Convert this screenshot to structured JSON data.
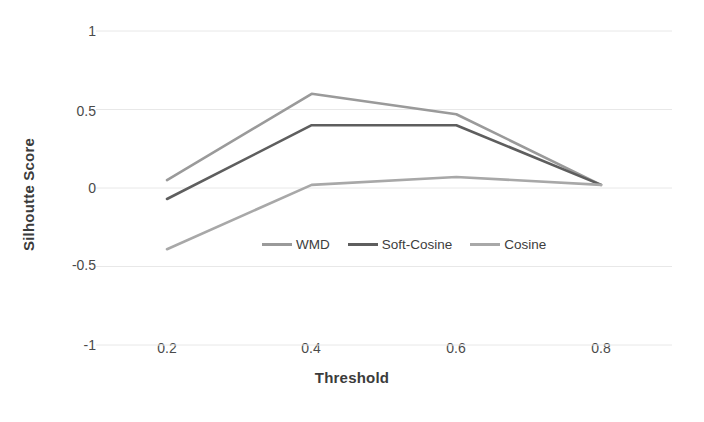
{
  "chart_data": {
    "type": "line",
    "title": "",
    "xlabel": "Threshold",
    "ylabel": "Silhoutte Score",
    "x": [
      0.2,
      0.4,
      0.6,
      0.8
    ],
    "xtick_labels": [
      "0.2",
      "0.4",
      "0.6",
      "0.8"
    ],
    "ytick_labels": [
      "1",
      "0.5",
      "0",
      "-0.5",
      "-1"
    ],
    "ytick_values": [
      1,
      0.5,
      0,
      -0.5,
      -1
    ],
    "ylim": [
      -1,
      1
    ],
    "xlim": [
      0.1,
      0.9
    ],
    "grid": "horizontal",
    "legend_position": "inside-center",
    "series": [
      {
        "name": "WMD",
        "color": "#9a9a9a",
        "values": [
          0.05,
          0.6,
          0.47,
          0.02
        ]
      },
      {
        "name": "Soft-Cosine",
        "color": "#5e5e5e",
        "values": [
          -0.07,
          0.4,
          0.4,
          0.02
        ]
      },
      {
        "name": "Cosine",
        "color": "#a8a8a8",
        "values": [
          -0.39,
          0.02,
          0.07,
          0.02
        ]
      }
    ]
  },
  "colors": {
    "background": "#ffffff",
    "gridline": "#e8e8e8",
    "tick_text": "#4a4a4a",
    "axis_title": "#3b3b3b"
  }
}
